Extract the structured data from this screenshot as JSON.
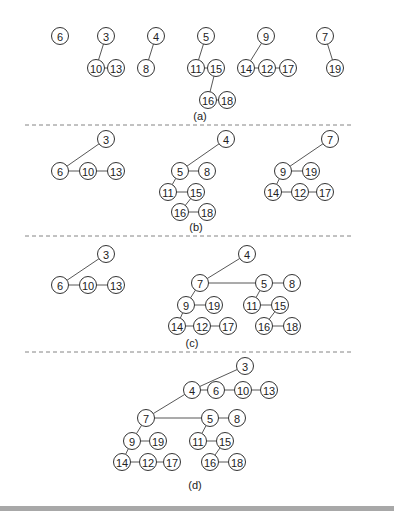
{
  "figure": {
    "node_radius": 8.5,
    "panels": [
      {
        "id": "a",
        "caption": "(a)",
        "caption_pos": [
          200,
          120
        ],
        "nodes": [
          {
            "label": "6",
            "x": 60,
            "y": 36
          },
          {
            "label": "3",
            "x": 106,
            "y": 36
          },
          {
            "label": "10",
            "x": 96,
            "y": 68
          },
          {
            "label": "13",
            "x": 116,
            "y": 68
          },
          {
            "label": "4",
            "x": 156,
            "y": 36
          },
          {
            "label": "8",
            "x": 146,
            "y": 68
          },
          {
            "label": "5",
            "x": 206,
            "y": 36
          },
          {
            "label": "11",
            "x": 196,
            "y": 68
          },
          {
            "label": "15",
            "x": 216,
            "y": 68
          },
          {
            "label": "16",
            "x": 208,
            "y": 100
          },
          {
            "label": "18",
            "x": 227,
            "y": 100
          },
          {
            "label": "9",
            "x": 266,
            "y": 36
          },
          {
            "label": "14",
            "x": 246,
            "y": 68
          },
          {
            "label": "12",
            "x": 267,
            "y": 68
          },
          {
            "label": "17",
            "x": 288,
            "y": 68
          },
          {
            "label": "7",
            "x": 325,
            "y": 36
          },
          {
            "label": "19",
            "x": 335,
            "y": 68
          }
        ],
        "edges": [
          [
            "3",
            "10"
          ],
          [
            "10",
            "13"
          ],
          [
            "4",
            "8"
          ],
          [
            "5",
            "11"
          ],
          [
            "11",
            "15"
          ],
          [
            "15",
            "16"
          ],
          [
            "16",
            "18"
          ],
          [
            "9",
            "14"
          ],
          [
            "14",
            "12"
          ],
          [
            "12",
            "17"
          ],
          [
            "7",
            "19"
          ]
        ]
      },
      {
        "id": "b",
        "caption": "(b)",
        "caption_pos": [
          196,
          231
        ],
        "nodes": [
          {
            "label": "3",
            "x": 106,
            "y": 139
          },
          {
            "label": "6",
            "x": 60,
            "y": 171
          },
          {
            "label": "10",
            "x": 88,
            "y": 171
          },
          {
            "label": "13",
            "x": 116,
            "y": 171
          },
          {
            "label": "4",
            "x": 226,
            "y": 139
          },
          {
            "label": "5",
            "x": 180,
            "y": 171
          },
          {
            "label": "8",
            "x": 207,
            "y": 171
          },
          {
            "label": "11",
            "x": 168,
            "y": 192
          },
          {
            "label": "15",
            "x": 196,
            "y": 192
          },
          {
            "label": "16",
            "x": 180,
            "y": 212
          },
          {
            "label": "18",
            "x": 207,
            "y": 212
          },
          {
            "label": "7",
            "x": 330,
            "y": 139
          },
          {
            "label": "9",
            "x": 283,
            "y": 171
          },
          {
            "label": "19",
            "x": 311,
            "y": 171
          },
          {
            "label": "14",
            "x": 273,
            "y": 192
          },
          {
            "label": "12",
            "x": 300,
            "y": 192
          },
          {
            "label": "17",
            "x": 325,
            "y": 192
          }
        ],
        "edges": [
          [
            "3",
            "6"
          ],
          [
            "6",
            "10"
          ],
          [
            "10",
            "13"
          ],
          [
            "4",
            "5"
          ],
          [
            "5",
            "8"
          ],
          [
            "5",
            "11"
          ],
          [
            "11",
            "15"
          ],
          [
            "15",
            "16"
          ],
          [
            "16",
            "18"
          ],
          [
            "7",
            "9"
          ],
          [
            "9",
            "19"
          ],
          [
            "9",
            "14"
          ],
          [
            "14",
            "12"
          ],
          [
            "12",
            "17"
          ]
        ]
      },
      {
        "id": "c",
        "caption": "(c)",
        "caption_pos": [
          192,
          347
        ],
        "nodes": [
          {
            "label": "3",
            "x": 106,
            "y": 254
          },
          {
            "label": "6",
            "x": 60,
            "y": 285
          },
          {
            "label": "10",
            "x": 88,
            "y": 285
          },
          {
            "label": "13",
            "x": 116,
            "y": 285
          },
          {
            "label": "4",
            "x": 247,
            "y": 254
          },
          {
            "label": "7",
            "x": 200,
            "y": 283
          },
          {
            "label": "5",
            "x": 264,
            "y": 283
          },
          {
            "label": "8",
            "x": 292,
            "y": 283
          },
          {
            "label": "9",
            "x": 186,
            "y": 305
          },
          {
            "label": "19",
            "x": 214,
            "y": 305
          },
          {
            "label": "11",
            "x": 252,
            "y": 305
          },
          {
            "label": "15",
            "x": 280,
            "y": 305
          },
          {
            "label": "14",
            "x": 177,
            "y": 326
          },
          {
            "label": "12",
            "x": 202,
            "y": 326
          },
          {
            "label": "17",
            "x": 228,
            "y": 326
          },
          {
            "label": "16",
            "x": 264,
            "y": 326
          },
          {
            "label": "18",
            "x": 292,
            "y": 326
          }
        ],
        "edges": [
          [
            "3",
            "6"
          ],
          [
            "6",
            "10"
          ],
          [
            "10",
            "13"
          ],
          [
            "4",
            "7"
          ],
          [
            "7",
            "5"
          ],
          [
            "5",
            "8"
          ],
          [
            "7",
            "9"
          ],
          [
            "9",
            "19"
          ],
          [
            "9",
            "14"
          ],
          [
            "14",
            "12"
          ],
          [
            "12",
            "17"
          ],
          [
            "5",
            "11"
          ],
          [
            "11",
            "15"
          ],
          [
            "15",
            "16"
          ],
          [
            "16",
            "18"
          ]
        ]
      },
      {
        "id": "d",
        "caption": "(d)",
        "caption_pos": [
          195,
          489
        ],
        "nodes": [
          {
            "label": "3",
            "x": 245,
            "y": 366
          },
          {
            "label": "4",
            "x": 192,
            "y": 390
          },
          {
            "label": "6",
            "x": 216,
            "y": 390
          },
          {
            "label": "10",
            "x": 243,
            "y": 390
          },
          {
            "label": "13",
            "x": 269,
            "y": 390
          },
          {
            "label": "7",
            "x": 146,
            "y": 418
          },
          {
            "label": "5",
            "x": 210,
            "y": 418
          },
          {
            "label": "8",
            "x": 237,
            "y": 418
          },
          {
            "label": "9",
            "x": 132,
            "y": 441
          },
          {
            "label": "19",
            "x": 158,
            "y": 441
          },
          {
            "label": "11",
            "x": 198,
            "y": 441
          },
          {
            "label": "15",
            "x": 225,
            "y": 441
          },
          {
            "label": "14",
            "x": 122,
            "y": 462
          },
          {
            "label": "12",
            "x": 148,
            "y": 462
          },
          {
            "label": "17",
            "x": 172,
            "y": 462
          },
          {
            "label": "16",
            "x": 210,
            "y": 462
          },
          {
            "label": "18",
            "x": 237,
            "y": 462
          }
        ],
        "edges": [
          [
            "3",
            "4"
          ],
          [
            "4",
            "6"
          ],
          [
            "6",
            "10"
          ],
          [
            "10",
            "13"
          ],
          [
            "4",
            "7"
          ],
          [
            "7",
            "5"
          ],
          [
            "5",
            "8"
          ],
          [
            "7",
            "9"
          ],
          [
            "9",
            "19"
          ],
          [
            "9",
            "14"
          ],
          [
            "14",
            "12"
          ],
          [
            "12",
            "17"
          ],
          [
            "5",
            "11"
          ],
          [
            "11",
            "15"
          ],
          [
            "15",
            "16"
          ],
          [
            "16",
            "18"
          ]
        ]
      }
    ],
    "separators": [
      {
        "y": 125,
        "x1": 25,
        "x2": 352
      },
      {
        "y": 236,
        "x1": 25,
        "x2": 352
      },
      {
        "y": 352,
        "x1": 25,
        "x2": 352
      }
    ],
    "bottom_bar_color": "#a8a8a8"
  }
}
